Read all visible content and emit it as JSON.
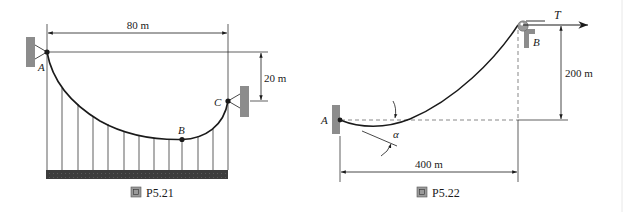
{
  "figures": [
    {
      "id": "P5.21",
      "caption_icon": "figure-icon",
      "caption": "P5.21",
      "dimensions": {
        "span": "80 m",
        "sag_difference": "20 m"
      },
      "points": {
        "a": "A",
        "b": "B",
        "c": "C"
      }
    },
    {
      "id": "P5.22",
      "caption_icon": "figure-icon",
      "caption": "P5.22",
      "dimensions": {
        "horizontal": "400 m",
        "vertical": "200 m"
      },
      "points": {
        "a": "A",
        "b": "B"
      },
      "force_label": "T",
      "angle_label": "α"
    }
  ],
  "colors": {
    "line": "#1a1a1a",
    "support": "#8c8c8c",
    "ground": "#3a3a3a",
    "dashed": "#555555"
  }
}
